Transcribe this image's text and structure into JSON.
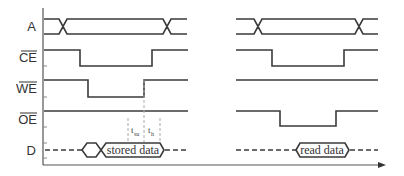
{
  "diagram": {
    "signals": [
      {
        "name": "A",
        "active_low": false
      },
      {
        "name": "CE",
        "active_low": true
      },
      {
        "name": "WE",
        "active_low": true
      },
      {
        "name": "OE",
        "active_low": true
      },
      {
        "name": "D",
        "active_low": false
      }
    ],
    "write_cycle": {
      "data_label": "stored data",
      "timing": [
        {
          "symbol": "t",
          "subscript": "su"
        },
        {
          "symbol": "t",
          "subscript": "h"
        }
      ]
    },
    "read_cycle": {
      "data_label": "read data"
    },
    "axis": {
      "x_arrow": true
    },
    "colors": {
      "line": "#3a3a3a",
      "text": "#333333",
      "guide": "#aaaaaa"
    }
  }
}
